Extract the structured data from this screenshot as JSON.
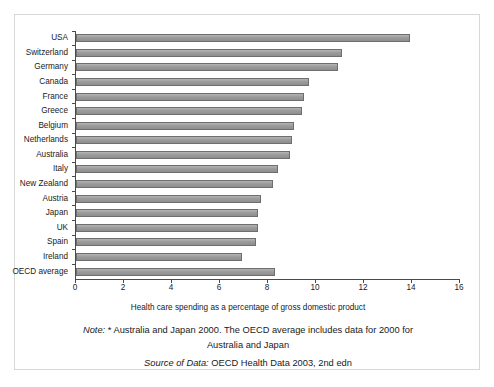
{
  "chart_data": {
    "type": "bar",
    "orientation": "horizontal",
    "title": "",
    "xlabel": "Health care spending as a percentage of gross domestic product",
    "ylabel": "",
    "xlim": [
      0,
      16
    ],
    "xticks": [
      0,
      2,
      4,
      6,
      8,
      10,
      12,
      14,
      16
    ],
    "grid": false,
    "legend": "none",
    "bar_color": "#9b9b9b",
    "bar_edge_color": "#6e6e6e",
    "categories": [
      "USA",
      "Switzerland",
      "Germany",
      "Canada",
      "France",
      "Greece",
      "Belgium",
      "Netherlands",
      "Australia",
      "Italy",
      "New Zealand",
      "Austria",
      "Japan",
      "UK",
      "Spain",
      "Ireland",
      "OECD average"
    ],
    "values": [
      13.9,
      11.1,
      10.9,
      9.7,
      9.5,
      9.4,
      9.1,
      9.0,
      8.9,
      8.4,
      8.2,
      7.7,
      7.6,
      7.6,
      7.5,
      6.9,
      8.3
    ]
  },
  "caption": {
    "note_label": "Note:",
    "note_text_line1": "* Australia and Japan 2000. The OECD average includes data for 2000 for",
    "note_text_line2": "Australia and Japan",
    "source_label": "Source of Data:",
    "source_text": "OECD Health Data 2003, 2nd edn"
  }
}
